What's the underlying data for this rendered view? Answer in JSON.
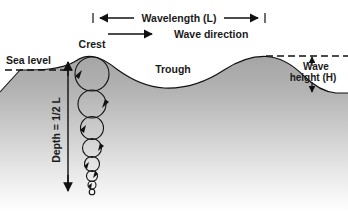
{
  "diagram": {
    "labels": {
      "wavelength": "Wavelength (L)",
      "wave_direction": "Wave direction",
      "crest": "Crest",
      "trough": "Trough",
      "sea_level": "Sea level",
      "depth": "Depth = 1/2 L",
      "wave_height": "Wave",
      "wave_height_2": "height (H)"
    },
    "colors": {
      "ink": "#111111",
      "water_top": "#a9a9a9",
      "water_bottom": "#ffffff",
      "background": "#ffffff"
    },
    "measurements": {
      "wavelength_span_px": 174,
      "crest_x_px": 92,
      "second_crest_x_px": 266,
      "sea_level_y_px": 70,
      "crest_y_px": 57,
      "trough_y_px": 88,
      "depth_arrow_top_y_px": 68,
      "depth_arrow_bottom_y_px": 192,
      "orbital_circle_count": 8
    },
    "orbitals": [
      {
        "cx": 92,
        "cy": 74,
        "r": 17
      },
      {
        "cx": 92,
        "cy": 104,
        "r": 14
      },
      {
        "cx": 92,
        "cy": 128,
        "r": 11.5
      },
      {
        "cx": 92,
        "cy": 148,
        "r": 9.5
      },
      {
        "cx": 92,
        "cy": 164,
        "r": 7.5
      },
      {
        "cx": 92,
        "cy": 176,
        "r": 5.5
      },
      {
        "cx": 92,
        "cy": 185,
        "r": 4
      },
      {
        "cx": 92,
        "cy": 192,
        "r": 2.8
      }
    ]
  }
}
